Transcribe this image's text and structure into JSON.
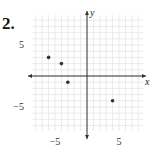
{
  "problem_number": "2.",
  "chart_data": {
    "type": "scatter",
    "title": "",
    "xlabel": "x",
    "ylabel": "y",
    "xlim": [
      -8.5,
      8.75
    ],
    "ylim": [
      -8.9,
      9.8
    ],
    "grid": true,
    "grid_step": 1,
    "x_tick_labels": [
      {
        "value": -5,
        "label": "−5"
      },
      {
        "value": 5,
        "label": "5"
      }
    ],
    "y_tick_labels": [
      {
        "value": 5,
        "label": "5"
      },
      {
        "value": -5,
        "label": "−5"
      }
    ],
    "points": [
      {
        "x": -6,
        "y": 3
      },
      {
        "x": -4,
        "y": 2
      },
      {
        "x": -3,
        "y": -1
      },
      {
        "x": 4,
        "y": -4
      }
    ],
    "colors": {
      "grid": "#e2e2e2",
      "axis": "#333333",
      "point": "#333333"
    }
  }
}
